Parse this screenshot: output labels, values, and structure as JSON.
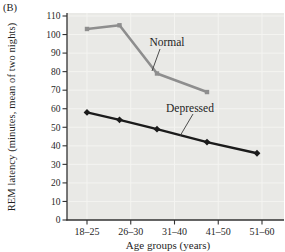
{
  "figure": {
    "panel_label": "(B)",
    "background": "#ffffff",
    "plot_background": "#e9e9e6",
    "gridline_color": "#f4f4f1",
    "axis_color": "#323232",
    "text_color": "#1f1f1f"
  },
  "chart_data": {
    "type": "line",
    "title": "",
    "xlabel": "Age groups (years)",
    "ylabel": "REM latency (minutes, mean of two nights)",
    "categories": [
      "18–25",
      "26–30",
      "31–40",
      "41–50",
      "51–60"
    ],
    "y_ticks": [
      0,
      10,
      20,
      30,
      40,
      50,
      60,
      70,
      80,
      90,
      100,
      110
    ],
    "ylim": [
      0,
      110
    ],
    "grid": "on",
    "legend_position": "inline-annotations-with-leader-lines",
    "x_scale_note": "linear in age; points plotted at age-group midpoints",
    "series": [
      {
        "name": "Normal",
        "color": "#8e8e8e",
        "marker": "square",
        "line_width": 2.6,
        "points": [
          {
            "age_group": "18–25",
            "age_mid": 21.5,
            "value": 103
          },
          {
            "age_group": "26–30",
            "age_mid": 28,
            "value": 105
          },
          {
            "age_group": "31–40",
            "age_mid": 35.5,
            "value": 79
          },
          {
            "age_group": "41–50",
            "age_mid": 45.5,
            "value": 69
          }
        ]
      },
      {
        "name": "Depressed",
        "color": "#1b1b1b",
        "marker": "diamond",
        "line_width": 2.4,
        "points": [
          {
            "age_group": "18–25",
            "age_mid": 21.5,
            "value": 58
          },
          {
            "age_group": "26–30",
            "age_mid": 28,
            "value": 54
          },
          {
            "age_group": "31–40",
            "age_mid": 35.5,
            "value": 49
          },
          {
            "age_group": "41–50",
            "age_mid": 45.5,
            "value": 42
          },
          {
            "age_group": "51–60",
            "age_mid": 55.5,
            "value": 36
          }
        ]
      }
    ],
    "annotations": [
      {
        "text": "Normal",
        "cx": 167,
        "cy": 42,
        "leader": [
          160,
          49,
          152,
          71
        ]
      },
      {
        "text": "Depressed",
        "cx": 190,
        "cy": 108,
        "leader": [
          193,
          114,
          180,
          136
        ]
      }
    ]
  }
}
